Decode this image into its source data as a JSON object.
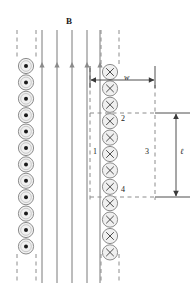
{
  "figure": {
    "title_label": "B",
    "colors": {
      "line": "#7a7a7a",
      "dashed": "#8c8c8c",
      "circle_fill": "#f0f0f0",
      "circle_stroke": "#808080",
      "text": "#1a1a1a",
      "arrow": "#5a5a5a",
      "background": "#ffffff"
    },
    "field": {
      "label": "B",
      "line_count": 5,
      "direction": "up",
      "x_positions": [
        42,
        57,
        72,
        87,
        100
      ],
      "y_top": 30,
      "y_bottom": 283,
      "arrow_y": 67
    },
    "left_column": {
      "name": "current-out-of-page-column",
      "symbol": "dot",
      "symbol_meaning": "current out of page",
      "count": 11,
      "cx": 26,
      "cy_start": 66,
      "cy_step": 16.4,
      "radius": 7.6,
      "dot_radius": 2.0
    },
    "right_column": {
      "name": "current-into-page-column",
      "symbol": "cross",
      "symbol_meaning": "current into page",
      "count": 12,
      "cx": 110,
      "cy_start": 72,
      "cy_step": 16.4,
      "radius": 7.6
    },
    "left_dashed_bounds": {
      "x_left": 17,
      "x_right": 36
    },
    "right_dashed_bounds": {
      "x_left": 101,
      "x_right": 119
    },
    "dashed_top": {
      "y_start": 30,
      "y_end": 58
    },
    "dashed_bottom": {
      "y_start": 254,
      "y_end": 283
    },
    "loop": {
      "name": "amperian-loop",
      "x_left": 90,
      "x_right": 155,
      "y_top": 113,
      "y_bottom": 197,
      "segments": [
        {
          "id": "1",
          "label": "1",
          "position": "left",
          "x": 93,
          "y": 152
        },
        {
          "id": "2",
          "label": "2",
          "position": "top",
          "x": 121,
          "y": 119
        },
        {
          "id": "3",
          "label": "3",
          "position": "right",
          "x": 147,
          "y": 152
        },
        {
          "id": "4",
          "label": "4",
          "position": "bottom",
          "x": 121,
          "y": 190
        }
      ]
    },
    "dimensions": {
      "width": {
        "label": "w",
        "y": 80,
        "x_start": 90,
        "x_end": 155,
        "tick_top": 66,
        "label_x": 126,
        "label_y": 76
      },
      "length": {
        "label": "ℓ",
        "x": 176,
        "y_top": 113,
        "y_bottom": 197,
        "label_x": 179,
        "label_y": 150,
        "extension_start": 155,
        "extension_end": 190
      }
    }
  }
}
